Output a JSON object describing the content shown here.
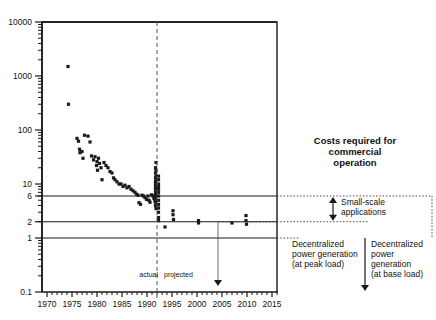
{
  "chart_data": {
    "type": "scatter",
    "title": "",
    "xlabel": "",
    "ylabel": "",
    "xlim": [
      1969,
      2016
    ],
    "ylim": [
      0.1,
      10000
    ],
    "yscale": "log",
    "grid": false,
    "legend_position": "none",
    "y_tick_labels": [
      "10000",
      "1000",
      "100",
      "10",
      "6",
      "2",
      "1",
      "0.1"
    ],
    "y_tick_values": [
      10000,
      1000,
      100,
      10,
      6,
      2,
      1,
      0.1
    ],
    "x_tick_labels": [
      "1970",
      "1975",
      "1980",
      "1985",
      "1990",
      "1995",
      "2000",
      "2005",
      "2010",
      "2015"
    ],
    "x_tick_values": [
      1970,
      1975,
      1980,
      1985,
      1990,
      1995,
      2000,
      2005,
      2010,
      2015
    ],
    "reference_lines": [
      {
        "name": "commercial-operation-threshold",
        "value": 6
      },
      {
        "name": "small-scale-applications-lower",
        "value": 2
      },
      {
        "name": "decentralized-peak-load-lower",
        "value": 1
      }
    ],
    "divider": {
      "x": 1992,
      "left_label": "actual",
      "right_label": "projected"
    },
    "series": [
      {
        "name": "module-price",
        "points": [
          [
            1974.2,
            1500
          ],
          [
            1974.3,
            300
          ],
          [
            1976.0,
            70
          ],
          [
            1976.3,
            62
          ],
          [
            1976.5,
            44
          ],
          [
            1976.6,
            38
          ],
          [
            1977.0,
            40
          ],
          [
            1977.2,
            30
          ],
          [
            1977.5,
            80
          ],
          [
            1978.2,
            77
          ],
          [
            1978.6,
            60
          ],
          [
            1978.9,
            33
          ],
          [
            1979.3,
            28
          ],
          [
            1979.6,
            32
          ],
          [
            1979.9,
            22
          ],
          [
            1980.0,
            26
          ],
          [
            1980.1,
            18
          ],
          [
            1980.3,
            30
          ],
          [
            1980.5,
            24
          ],
          [
            1980.8,
            20
          ],
          [
            1981.0,
            12
          ],
          [
            1981.4,
            25
          ],
          [
            1981.8,
            22
          ],
          [
            1982.2,
            20
          ],
          [
            1982.6,
            17
          ],
          [
            1983.0,
            16
          ],
          [
            1983.3,
            13
          ],
          [
            1983.6,
            12
          ],
          [
            1984.0,
            11
          ],
          [
            1984.4,
            10
          ],
          [
            1984.8,
            10
          ],
          [
            1985.2,
            9
          ],
          [
            1985.6,
            9.5
          ],
          [
            1986.0,
            8.5
          ],
          [
            1986.4,
            9
          ],
          [
            1986.8,
            8
          ],
          [
            1987.2,
            7.5
          ],
          [
            1987.6,
            7
          ],
          [
            1987.9,
            6.5
          ],
          [
            1988.2,
            6.2
          ],
          [
            1988.4,
            4.5
          ],
          [
            1988.7,
            4.2
          ],
          [
            1989.0,
            6.2
          ],
          [
            1989.3,
            6.0
          ],
          [
            1989.6,
            5.6
          ],
          [
            1989.9,
            5.2
          ],
          [
            1990.2,
            6.0
          ],
          [
            1990.4,
            5.0
          ],
          [
            1990.6,
            4.6
          ],
          [
            1990.9,
            6.3
          ],
          [
            1991.2,
            6.0
          ],
          [
            1991.4,
            5.4
          ],
          [
            1991.6,
            4.8
          ],
          [
            1991.7,
            20
          ],
          [
            1991.7,
            16
          ],
          [
            1991.7,
            13
          ],
          [
            1991.7,
            11
          ],
          [
            1991.7,
            10
          ],
          [
            1991.7,
            9
          ],
          [
            1991.7,
            8
          ],
          [
            1991.7,
            7
          ],
          [
            1991.7,
            6.4
          ],
          [
            1991.7,
            5.8
          ],
          [
            1991.7,
            5.2
          ],
          [
            1991.7,
            4.6
          ],
          [
            1991.7,
            4.0
          ],
          [
            1991.8,
            25
          ],
          [
            1991.8,
            18
          ],
          [
            1991.8,
            14
          ],
          [
            1991.8,
            12
          ],
          [
            1991.8,
            3.5
          ],
          [
            1992.3,
            14
          ],
          [
            1992.3,
            12
          ],
          [
            1992.3,
            10
          ],
          [
            1992.3,
            9
          ],
          [
            1992.3,
            8
          ],
          [
            1992.3,
            7
          ],
          [
            1992.3,
            6
          ],
          [
            1992.3,
            5
          ],
          [
            1992.3,
            4.2
          ],
          [
            1992.3,
            3.6
          ],
          [
            1992.3,
            3.0
          ],
          [
            1992.3,
            2.4
          ],
          [
            1992.3,
            2.1
          ],
          [
            1993.6,
            1.6
          ],
          [
            1995.2,
            3.2
          ],
          [
            1995.2,
            2.7
          ],
          [
            1995.3,
            2.2
          ],
          [
            2000.3,
            2.1
          ],
          [
            2000.3,
            1.9
          ],
          [
            2007.0,
            1.9
          ],
          [
            2009.8,
            2.6
          ],
          [
            2009.8,
            2.1
          ],
          [
            2009.9,
            1.8
          ]
        ]
      }
    ],
    "annotations": [
      {
        "name": "costs-required-commercial-operation",
        "lines": [
          "Costs required for",
          "commercial",
          "operation"
        ],
        "style": "bold"
      },
      {
        "name": "small-scale-applications",
        "lines": [
          "Small-scale",
          "applications"
        ],
        "style": "plain"
      },
      {
        "name": "decentralized-power-generation-peak-load",
        "lines": [
          "Decentralized",
          "power generation",
          "(at peak load)"
        ],
        "style": "plain"
      },
      {
        "name": "decentralized-power-generation-base-load",
        "lines": [
          "Decentralized",
          "power",
          "generation",
          "(at base load)"
        ],
        "style": "plain"
      }
    ]
  },
  "colors": {
    "axis": "#1a1a1a",
    "datapoint": "#1a1a1a",
    "background": "#ffffff",
    "divider": "#555555"
  }
}
